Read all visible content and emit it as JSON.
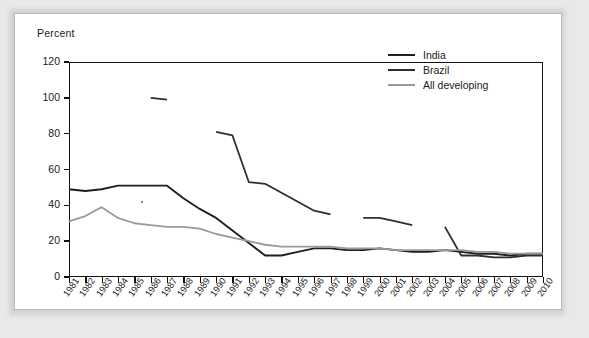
{
  "figure": {
    "ylabel": "Percent"
  },
  "legend": {
    "position": "top-right",
    "entries": [
      {
        "label": "India",
        "color": "#1f1f1f",
        "width": 2.4
      },
      {
        "label": "Brazil",
        "color": "#2e2e2e",
        "width": 2.2
      },
      {
        "label": "All developing",
        "color": "#9a9a9a",
        "width": 2.2
      }
    ]
  },
  "chart_data": {
    "type": "line",
    "title": "",
    "xlabel": "",
    "ylabel": "Percent",
    "xlim": [
      1981,
      2010
    ],
    "ylim": [
      0,
      120
    ],
    "yticks": [
      0,
      20,
      40,
      60,
      80,
      100,
      120
    ],
    "grid": false,
    "x": [
      1981,
      1982,
      1983,
      1984,
      1985,
      1986,
      1987,
      1988,
      1989,
      1990,
      1991,
      1992,
      1993,
      1994,
      1995,
      1996,
      1997,
      1998,
      1999,
      2000,
      2001,
      2002,
      2003,
      2004,
      2005,
      2006,
      2007,
      2008,
      2009,
      2010
    ],
    "series": [
      {
        "name": "India",
        "color": "#1f1f1f",
        "values": [
          49,
          48,
          49,
          51,
          51,
          51,
          51,
          44,
          38,
          33,
          26,
          19,
          12,
          12,
          14,
          16,
          16,
          15,
          15,
          16,
          15,
          14,
          14,
          15,
          14,
          13,
          13,
          12,
          13,
          13
        ]
      },
      {
        "name": "Brazil",
        "color": "#2e2e2e",
        "values": [
          null,
          null,
          null,
          null,
          null,
          100,
          99,
          null,
          null,
          81,
          79,
          53,
          52,
          47,
          42,
          37,
          35,
          null,
          33,
          33,
          31,
          29,
          null,
          28,
          12,
          12,
          11,
          11,
          12,
          12
        ]
      },
      {
        "name": "All developing",
        "color": "#9a9a9a",
        "values": [
          31,
          34,
          39,
          33,
          30,
          29,
          28,
          28,
          27,
          24,
          22,
          20,
          18,
          17,
          17,
          17,
          17,
          16,
          16,
          16,
          15,
          15,
          15,
          15,
          15,
          14,
          14,
          13,
          13,
          13
        ]
      }
    ]
  }
}
